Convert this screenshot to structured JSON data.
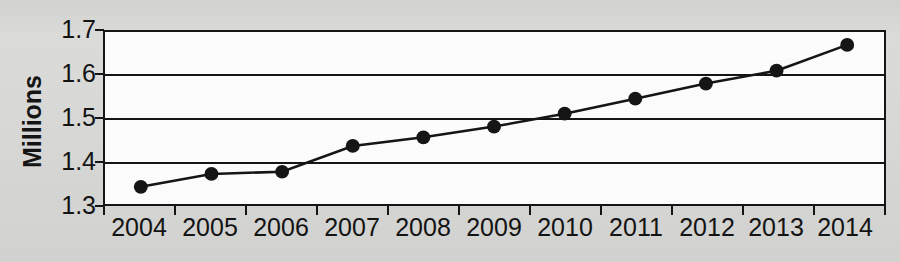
{
  "chart_data": {
    "type": "line",
    "title": "",
    "subtitle": "",
    "xlabel": "",
    "ylabel": "Millions",
    "categories": [
      "2004",
      "2005",
      "2006",
      "2007",
      "2008",
      "2009",
      "2010",
      "2011",
      "2012",
      "2013",
      "2014"
    ],
    "values": [
      1.34,
      1.37,
      1.375,
      1.435,
      1.455,
      1.48,
      1.51,
      1.545,
      1.58,
      1.61,
      1.67
    ],
    "series": [
      {
        "name": "",
        "values": [
          1.34,
          1.37,
          1.375,
          1.435,
          1.455,
          1.48,
          1.51,
          1.545,
          1.58,
          1.61,
          1.67
        ]
      }
    ],
    "ylim": [
      1.3,
      1.7
    ],
    "y_ticks": [
      "1.3",
      "1.4",
      "1.5",
      "1.6",
      "1.7"
    ],
    "y_tick_values": [
      1.3,
      1.4,
      1.5,
      1.6,
      1.7
    ],
    "x_ticks": [
      "2004",
      "2005",
      "2006",
      "2007",
      "2008",
      "2009",
      "2010",
      "2011",
      "2012",
      "2013",
      "2014"
    ],
    "grid": true,
    "legend": "none",
    "marker": "filled-circle",
    "line_color": "#141414",
    "marker_color": "#141414",
    "plot_background": "#fdfdfd",
    "page_background": "#d9d9d7"
  }
}
